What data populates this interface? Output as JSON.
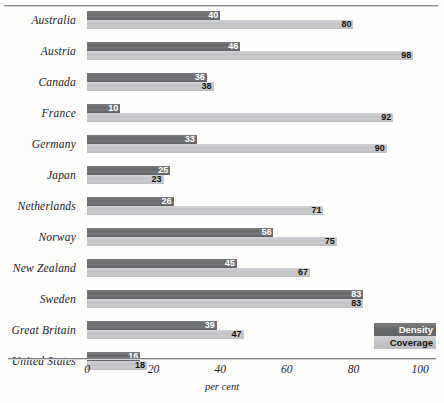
{
  "chart_data": {
    "type": "bar",
    "orientation": "horizontal",
    "title": "",
    "xlabel": "per cent",
    "ylabel": "",
    "xlim": [
      0,
      100
    ],
    "xticks": [
      0,
      20,
      40,
      60,
      80,
      100
    ],
    "grid": false,
    "legend_position": "bottom-right",
    "categories": [
      "Australia",
      "Austria",
      "Canada",
      "France",
      "Germany",
      "Japan",
      "Netherlands",
      "Norway",
      "New Zealand",
      "Sweden",
      "Great Britain",
      "United States"
    ],
    "series": [
      {
        "name": "Density",
        "color": "#6f7073",
        "values": [
          40,
          46,
          36,
          10,
          33,
          25,
          26,
          56,
          45,
          83,
          39,
          16
        ]
      },
      {
        "name": "Coverage",
        "color": "#c6c7ca",
        "values": [
          80,
          98,
          38,
          92,
          90,
          23,
          71,
          75,
          67,
          83,
          47,
          18
        ]
      }
    ]
  },
  "axis": {
    "tick_labels": [
      "0",
      "20",
      "40",
      "60",
      "80",
      "100"
    ],
    "title": "per cent"
  },
  "legend": {
    "density_label": "Density",
    "coverage_label": "Coverage"
  }
}
